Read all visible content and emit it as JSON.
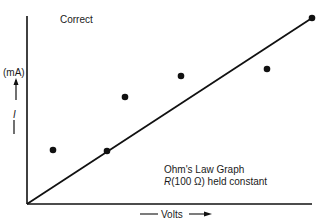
{
  "chart_data": {
    "type": "scatter",
    "title": "Correct",
    "xlabel": "Volts",
    "ylabel": "I (mA)",
    "ylabel_unit": "(mA)",
    "ylabel_symbol": "I",
    "annotations": [
      "Ohm's Law Graph",
      "R(100 Ω) held constant"
    ],
    "grid": false,
    "legend": null,
    "axes_ticks": "none",
    "series": [
      {
        "name": "measured points",
        "marker": "filled-circle",
        "points_px": [
          [
            53,
            150
          ],
          [
            107,
            151
          ],
          [
            125,
            97
          ],
          [
            181,
            76
          ],
          [
            267,
            69
          ],
          [
            312,
            18
          ]
        ],
        "x_rel": [
          0.09,
          0.28,
          0.34,
          0.54,
          0.84,
          1.0
        ],
        "y_rel": [
          0.28,
          0.28,
          0.57,
          0.68,
          0.72,
          1.0
        ]
      },
      {
        "name": "linear fit",
        "type": "line",
        "x_rel": [
          0.0,
          1.0
        ],
        "y_rel": [
          0.0,
          1.0
        ]
      }
    ],
    "xlim_rel": [
      0,
      1
    ],
    "ylim_rel": [
      0,
      1
    ]
  },
  "labels": {
    "title": "Correct",
    "ylabel_unit": "(mA)",
    "ylabel_symbol": "I",
    "xlabel": "Volts",
    "note_line1": "Ohm's Law Graph",
    "note_line2_symbol": "R",
    "note_line2_rest": "(100 Ω) held constant"
  },
  "colors": {
    "ink": "#111111",
    "background": "#ffffff"
  }
}
